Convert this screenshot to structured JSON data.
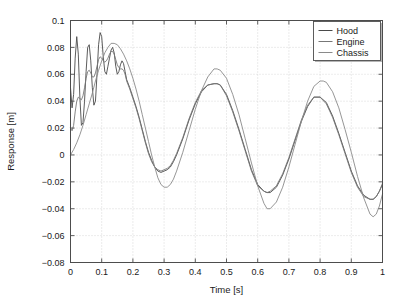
{
  "chart_data": {
    "type": "line",
    "title": "",
    "xlabel": "Time [s]",
    "ylabel": "Response [m]",
    "xlim": [
      0,
      1
    ],
    "ylim": [
      -0.08,
      0.1
    ],
    "xticks": [
      "0",
      "0.1",
      "0.2",
      "0.3",
      "0.4",
      "0.5",
      "0.6",
      "0.7",
      "0.8",
      "0.9",
      "1"
    ],
    "xtick_values": [
      0,
      0.1,
      0.2,
      0.3,
      0.4,
      0.5,
      0.6,
      0.7,
      0.8,
      0.9,
      1
    ],
    "yticks": [
      "0.1",
      "0.08",
      "0.06",
      "0.04",
      "0.02",
      "0",
      "-0.02",
      "-0.04",
      "-0.06",
      "-0.08"
    ],
    "ytick_values": [
      0.1,
      0.08,
      0.06,
      0.04,
      0.02,
      0,
      -0.02,
      -0.04,
      -0.06,
      -0.08
    ],
    "grid": true,
    "grid_style": "dotted",
    "grid_color": "#c8c8c8",
    "legend_position": "upper right",
    "legend_entries": [
      "Hood",
      "Engine",
      "Chassis"
    ],
    "series": [
      {
        "name": "Hood",
        "color": "#4a4a4a",
        "x": [
          0,
          0.005,
          0.01,
          0.015,
          0.02,
          0.025,
          0.03,
          0.035,
          0.04,
          0.045,
          0.05,
          0.055,
          0.06,
          0.065,
          0.07,
          0.075,
          0.08,
          0.085,
          0.09,
          0.095,
          0.1,
          0.105,
          0.11,
          0.115,
          0.12,
          0.125,
          0.13,
          0.135,
          0.14,
          0.145,
          0.15,
          0.155,
          0.16,
          0.165,
          0.17,
          0.175,
          0.18,
          0.19,
          0.2,
          0.21,
          0.22,
          0.23,
          0.24,
          0.25,
          0.26,
          0.27,
          0.28,
          0.29,
          0.3,
          0.31,
          0.32,
          0.33,
          0.34,
          0.36,
          0.38,
          0.4,
          0.42,
          0.44,
          0.46,
          0.47,
          0.48,
          0.5,
          0.52,
          0.54,
          0.56,
          0.58,
          0.6,
          0.62,
          0.63,
          0.64,
          0.66,
          0.68,
          0.7,
          0.72,
          0.74,
          0.76,
          0.78,
          0.8,
          0.82,
          0.84,
          0.86,
          0.88,
          0.9,
          0.92,
          0.94,
          0.96,
          0.97,
          0.98,
          0.99,
          1
        ],
        "y": [
          0.05,
          0.035,
          0.045,
          0.072,
          0.088,
          0.075,
          0.043,
          0.022,
          0.024,
          0.04,
          0.062,
          0.08,
          0.082,
          0.07,
          0.05,
          0.037,
          0.04,
          0.06,
          0.082,
          0.091,
          0.088,
          0.073,
          0.062,
          0.06,
          0.066,
          0.072,
          0.078,
          0.08,
          0.076,
          0.066,
          0.06,
          0.062,
          0.067,
          0.07,
          0.068,
          0.062,
          0.056,
          0.05,
          0.043,
          0.036,
          0.028,
          0.019,
          0.01,
          0.002,
          -0.004,
          -0.009,
          -0.012,
          -0.013,
          -0.012,
          -0.011,
          -0.009,
          -0.005,
          0.0,
          0.012,
          0.026,
          0.038,
          0.047,
          0.052,
          0.053,
          0.053,
          0.052,
          0.045,
          0.033,
          0.019,
          0.004,
          -0.011,
          -0.022,
          -0.027,
          -0.028,
          -0.028,
          -0.024,
          -0.015,
          -0.003,
          0.011,
          0.025,
          0.036,
          0.043,
          0.043,
          0.039,
          0.029,
          0.016,
          0.002,
          -0.012,
          -0.023,
          -0.03,
          -0.033,
          -0.033,
          -0.031,
          -0.027,
          -0.022
        ]
      },
      {
        "name": "Engine",
        "color": "#777777",
        "x": [
          0,
          0.005,
          0.01,
          0.015,
          0.02,
          0.025,
          0.03,
          0.035,
          0.04,
          0.045,
          0.05,
          0.055,
          0.06,
          0.065,
          0.07,
          0.075,
          0.08,
          0.085,
          0.09,
          0.095,
          0.1,
          0.105,
          0.11,
          0.115,
          0.12,
          0.125,
          0.13,
          0.135,
          0.14,
          0.145,
          0.15,
          0.155,
          0.16,
          0.165,
          0.17,
          0.175,
          0.18,
          0.19,
          0.2,
          0.21,
          0.22,
          0.23,
          0.24,
          0.25,
          0.26,
          0.27,
          0.28,
          0.29,
          0.3,
          0.31,
          0.32,
          0.33,
          0.34,
          0.36,
          0.38,
          0.4,
          0.42,
          0.44,
          0.46,
          0.47,
          0.48,
          0.5,
          0.52,
          0.54,
          0.56,
          0.58,
          0.6,
          0.62,
          0.63,
          0.64,
          0.66,
          0.68,
          0.7,
          0.72,
          0.74,
          0.76,
          0.78,
          0.8,
          0.82,
          0.84,
          0.86,
          0.88,
          0.9,
          0.92,
          0.94,
          0.96,
          0.97,
          0.98,
          0.99,
          1
        ],
        "y": [
          0.02,
          0.018,
          0.022,
          0.032,
          0.04,
          0.043,
          0.042,
          0.041,
          0.044,
          0.05,
          0.057,
          0.062,
          0.063,
          0.061,
          0.058,
          0.058,
          0.061,
          0.066,
          0.071,
          0.073,
          0.072,
          0.07,
          0.069,
          0.07,
          0.072,
          0.075,
          0.077,
          0.077,
          0.075,
          0.071,
          0.067,
          0.065,
          0.064,
          0.064,
          0.063,
          0.06,
          0.055,
          0.049,
          0.042,
          0.035,
          0.027,
          0.018,
          0.009,
          0.001,
          -0.005,
          -0.009,
          -0.011,
          -0.012,
          -0.011,
          -0.01,
          -0.008,
          -0.004,
          0.001,
          0.013,
          0.027,
          0.039,
          0.048,
          0.052,
          0.053,
          0.053,
          0.052,
          0.044,
          0.032,
          0.018,
          0.003,
          -0.012,
          -0.023,
          -0.027,
          -0.028,
          -0.027,
          -0.023,
          -0.014,
          -0.002,
          0.012,
          0.026,
          0.037,
          0.043,
          0.043,
          0.038,
          0.028,
          0.015,
          0.001,
          -0.013,
          -0.024,
          -0.031,
          -0.033,
          -0.033,
          -0.031,
          -0.027,
          -0.021
        ]
      },
      {
        "name": "Chassis",
        "color": "#8a8a8a",
        "x": [
          0,
          0.01,
          0.02,
          0.03,
          0.04,
          0.05,
          0.06,
          0.07,
          0.08,
          0.09,
          0.1,
          0.11,
          0.12,
          0.13,
          0.14,
          0.15,
          0.16,
          0.17,
          0.18,
          0.19,
          0.2,
          0.21,
          0.22,
          0.23,
          0.24,
          0.25,
          0.26,
          0.27,
          0.28,
          0.29,
          0.3,
          0.31,
          0.32,
          0.33,
          0.34,
          0.36,
          0.38,
          0.4,
          0.42,
          0.44,
          0.46,
          0.47,
          0.48,
          0.5,
          0.52,
          0.54,
          0.56,
          0.58,
          0.6,
          0.62,
          0.63,
          0.64,
          0.66,
          0.68,
          0.7,
          0.72,
          0.74,
          0.76,
          0.78,
          0.8,
          0.81,
          0.82,
          0.84,
          0.86,
          0.88,
          0.9,
          0.92,
          0.94,
          0.96,
          0.97,
          0.98,
          0.99,
          1
        ],
        "y": [
          0.0,
          0.004,
          0.009,
          0.015,
          0.022,
          0.03,
          0.038,
          0.046,
          0.055,
          0.063,
          0.07,
          0.076,
          0.08,
          0.083,
          0.083,
          0.082,
          0.079,
          0.075,
          0.07,
          0.064,
          0.057,
          0.049,
          0.04,
          0.03,
          0.02,
          0.01,
          0.0,
          -0.009,
          -0.017,
          -0.022,
          -0.024,
          -0.024,
          -0.022,
          -0.018,
          -0.012,
          0.002,
          0.018,
          0.034,
          0.048,
          0.058,
          0.064,
          0.064,
          0.063,
          0.057,
          0.045,
          0.03,
          0.012,
          -0.006,
          -0.023,
          -0.036,
          -0.04,
          -0.04,
          -0.035,
          -0.024,
          -0.009,
          0.008,
          0.025,
          0.04,
          0.051,
          0.055,
          0.055,
          0.054,
          0.047,
          0.035,
          0.019,
          0.002,
          -0.016,
          -0.032,
          -0.044,
          -0.046,
          -0.044,
          -0.038,
          -0.029
        ]
      }
    ]
  },
  "axes": {
    "xlabel": "Time [s]",
    "ylabel": "Response [m]"
  },
  "legend": {
    "items": [
      {
        "label": "Hood"
      },
      {
        "label": "Engine"
      },
      {
        "label": "Chassis"
      }
    ]
  }
}
